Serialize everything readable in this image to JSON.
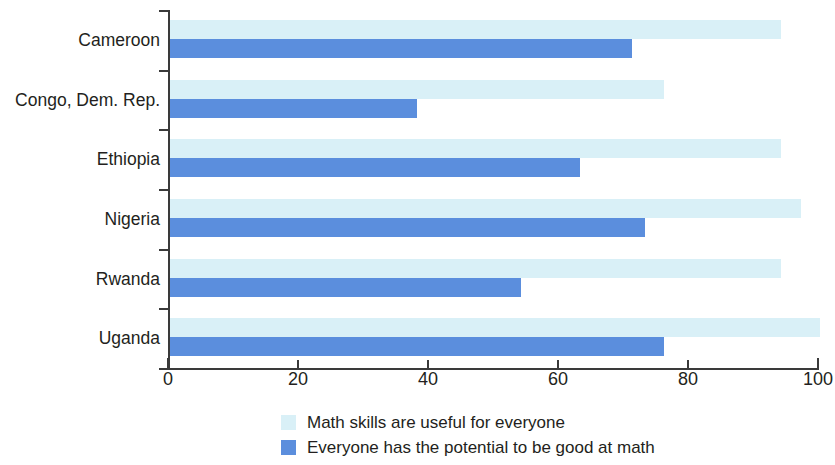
{
  "chart_data": {
    "type": "bar",
    "orientation": "horizontal",
    "title": "",
    "xlabel": "",
    "ylabel": "",
    "xlim": [
      0,
      100
    ],
    "xticks": [
      0,
      20,
      40,
      60,
      80,
      100
    ],
    "xtick_labels": [
      "0",
      "20",
      "40",
      "60",
      "80",
      "100"
    ],
    "grid": false,
    "legend_position": "bottom",
    "categories": [
      "Cameroon",
      "Congo, Dem. Rep.",
      "Ethiopia",
      "Nigeria",
      "Rwanda",
      "Uganda"
    ],
    "series": [
      {
        "name": "Math skills are useful for everyone",
        "color": "#d9f0f7",
        "values": [
          94,
          76,
          94,
          97,
          94,
          100
        ]
      },
      {
        "name": "Everyone has the potential to be good at math",
        "color": "#5b8edd",
        "values": [
          71,
          38,
          63,
          73,
          54,
          76
        ]
      }
    ]
  },
  "legend": {
    "items": [
      {
        "label": "Math skills are useful for everyone",
        "swatch": "light"
      },
      {
        "label": "Everyone has the potential to be good at math",
        "swatch": "dark"
      }
    ]
  }
}
